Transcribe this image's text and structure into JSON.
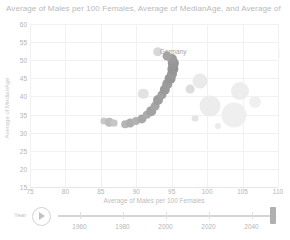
{
  "chart_title": "Average of Males per 100 Females, Average of MedianAge, and Average of",
  "year_watermark": "2050",
  "axes": {
    "x_title": "Average of Males per 100 Females",
    "y_title": "Average of MedianAge",
    "x_ticks": [
      "75",
      "80",
      "85",
      "90",
      "95",
      "100",
      "105",
      "110"
    ],
    "y_ticks": [
      "60",
      "55",
      "50",
      "45",
      "40",
      "35",
      "30",
      "25",
      "20",
      "15"
    ],
    "xlim": [
      75,
      110
    ],
    "ylim": [
      15,
      60
    ]
  },
  "timeline": {
    "label": "Year",
    "play_icon": "play-icon",
    "ticks": [
      "1960",
      "1980",
      "2000",
      "2020",
      "2040"
    ],
    "min": 1950,
    "max": 2050,
    "value": 2050
  },
  "annotations": [
    {
      "text": "Germany",
      "x": 95.2,
      "y": 52.6
    }
  ],
  "bottom_strip_text": "",
  "colors": {
    "bubble_dark": "#9a9a9a",
    "bubble_light": "#e9e9e9",
    "grid": "#f1f1f1",
    "axis_text": "#b5b5b5",
    "title_text": "#b9b9b9",
    "watermark": "#f3f2f0",
    "handle": "#b0b0b0"
  },
  "chart_data": {
    "type": "scatter",
    "title": "Average of Males per 100 Females, Average of MedianAge, and Average of",
    "xlabel": "Average of Males per 100 Females",
    "ylabel": "Average of MedianAge",
    "xlim": [
      75,
      110
    ],
    "ylim": [
      15,
      60
    ],
    "grid": true,
    "legend": "none",
    "size_encodes": "Average of Population",
    "points": [
      {
        "x": 85.4,
        "y": 33.2,
        "r": 3.6,
        "shade": "#c9c9c9"
      },
      {
        "x": 86.2,
        "y": 32.9,
        "r": 4.2,
        "shade": "#bdbdbd"
      },
      {
        "x": 86.9,
        "y": 32.6,
        "r": 3.4,
        "shade": "#c6c6c6"
      },
      {
        "x": 88.4,
        "y": 32.4,
        "r": 3.8,
        "shade": "#b6b6b6"
      },
      {
        "x": 89.1,
        "y": 32.6,
        "r": 4.4,
        "shade": "#aeaeae"
      },
      {
        "x": 90.0,
        "y": 33.1,
        "r": 4.0,
        "shade": "#b2b2b2"
      },
      {
        "x": 90.8,
        "y": 33.9,
        "r": 4.6,
        "shade": "#a8a8a8"
      },
      {
        "x": 91.5,
        "y": 34.9,
        "r": 4.2,
        "shade": "#ababab"
      },
      {
        "x": 92.1,
        "y": 36.0,
        "r": 4.8,
        "shade": "#a2a2a2"
      },
      {
        "x": 92.6,
        "y": 37.4,
        "r": 4.4,
        "shade": "#a6a6a6"
      },
      {
        "x": 93.1,
        "y": 38.9,
        "r": 5.0,
        "shade": "#9e9e9e"
      },
      {
        "x": 93.6,
        "y": 40.4,
        "r": 4.6,
        "shade": "#a0a0a0"
      },
      {
        "x": 94.0,
        "y": 41.9,
        "r": 5.2,
        "shade": "#9a9a9a"
      },
      {
        "x": 94.4,
        "y": 43.4,
        "r": 4.8,
        "shade": "#9c9c9c"
      },
      {
        "x": 94.8,
        "y": 44.9,
        "r": 5.4,
        "shade": "#979797"
      },
      {
        "x": 95.0,
        "y": 46.3,
        "r": 5.0,
        "shade": "#999999"
      },
      {
        "x": 95.2,
        "y": 47.7,
        "r": 5.6,
        "shade": "#949494"
      },
      {
        "x": 95.2,
        "y": 49.1,
        "r": 5.2,
        "shade": "#969696"
      },
      {
        "x": 95.0,
        "y": 50.3,
        "r": 5.0,
        "shade": "#9b9b9b"
      },
      {
        "x": 94.3,
        "y": 51.1,
        "r": 4.4,
        "shade": "#a4a4a4"
      },
      {
        "x": 93.0,
        "y": 52.4,
        "r": 4.8,
        "shade": "#d8d8d8"
      },
      {
        "x": 91.0,
        "y": 40.8,
        "r": 5.2,
        "shade": "#e2e2e2"
      },
      {
        "x": 97.6,
        "y": 42.0,
        "r": 4.4,
        "shade": "#dcdcdc"
      },
      {
        "x": 99.0,
        "y": 44.2,
        "r": 7.5,
        "shade": "#eaeaea"
      },
      {
        "x": 100.4,
        "y": 37.4,
        "r": 10.5,
        "shade": "#ececec"
      },
      {
        "x": 103.8,
        "y": 35.0,
        "r": 12.5,
        "shade": "#efefef"
      },
      {
        "x": 104.6,
        "y": 41.4,
        "r": 9.0,
        "shade": "#ededed"
      },
      {
        "x": 106.8,
        "y": 38.6,
        "r": 6.0,
        "shade": "#f0f0f0"
      },
      {
        "x": 98.3,
        "y": 33.9,
        "r": 3.4,
        "shade": "#e4e4e4"
      },
      {
        "x": 101.6,
        "y": 31.8,
        "r": 3.0,
        "shade": "#ebebeb"
      }
    ]
  }
}
